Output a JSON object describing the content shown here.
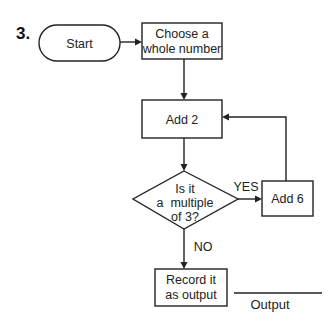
{
  "problem_number": "3.",
  "nodes": {
    "start": {
      "label": "Start"
    },
    "choose": {
      "line1": "Choose a",
      "line2": "whole number"
    },
    "add2": {
      "label": "Add 2"
    },
    "decision": {
      "line1": "Is it",
      "line2": "a  multiple",
      "line3": "of 3?"
    },
    "add6": {
      "label": "Add 6"
    },
    "record": {
      "line1": "Record it",
      "line2": "as output"
    }
  },
  "edges": {
    "yes_label": "YES",
    "no_label": "NO"
  },
  "output": {
    "label": "Output",
    "blank": ""
  },
  "colors": {
    "stroke": "#222222",
    "background": "#ffffff"
  }
}
